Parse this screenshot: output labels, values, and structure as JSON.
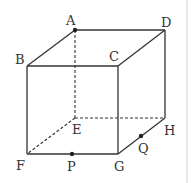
{
  "diagram": {
    "type": "cube",
    "vertices": {
      "A": {
        "x": 75,
        "y": 30,
        "label": "A",
        "lx": 66,
        "ly": 25
      },
      "B": {
        "x": 27,
        "y": 66,
        "label": "B",
        "lx": 15,
        "ly": 64
      },
      "C": {
        "x": 118,
        "y": 66,
        "label": "C",
        "lx": 109,
        "ly": 61
      },
      "D": {
        "x": 165,
        "y": 30,
        "label": "D",
        "lx": 161,
        "ly": 27
      },
      "E": {
        "x": 75,
        "y": 118,
        "label": "E",
        "lx": 72,
        "ly": 134
      },
      "F": {
        "x": 27,
        "y": 154,
        "label": "F",
        "lx": 16,
        "ly": 170
      },
      "G": {
        "x": 118,
        "y": 154,
        "label": "G",
        "lx": 114,
        "ly": 171
      },
      "H": {
        "x": 165,
        "y": 118,
        "label": "H",
        "lx": 164,
        "ly": 135
      }
    },
    "points": {
      "P": {
        "x": 72,
        "y": 154,
        "label": "P",
        "lx": 67,
        "ly": 171
      },
      "Q": {
        "x": 141,
        "y": 136,
        "label": "Q",
        "lx": 138,
        "ly": 153
      }
    },
    "solid_edges": [
      "A-D",
      "A-B",
      "B-C",
      "C-D",
      "B-F",
      "C-G",
      "D-H",
      "F-G",
      "G-H"
    ],
    "dashed_edges": [
      "A-E",
      "E-F",
      "E-H"
    ],
    "marked_points": [
      "A",
      "P",
      "Q"
    ]
  }
}
